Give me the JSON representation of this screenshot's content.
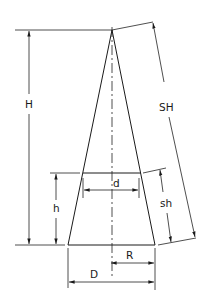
{
  "diagram": {
    "title": "",
    "shape": "cone with frustum section",
    "labels": {
      "H": "H",
      "SH": "SH",
      "h": "h",
      "sh": "sh",
      "d": "d",
      "R": "R",
      "D": "D"
    },
    "colors": {
      "line": "#1a1a1a",
      "background": "#ffffff"
    }
  }
}
